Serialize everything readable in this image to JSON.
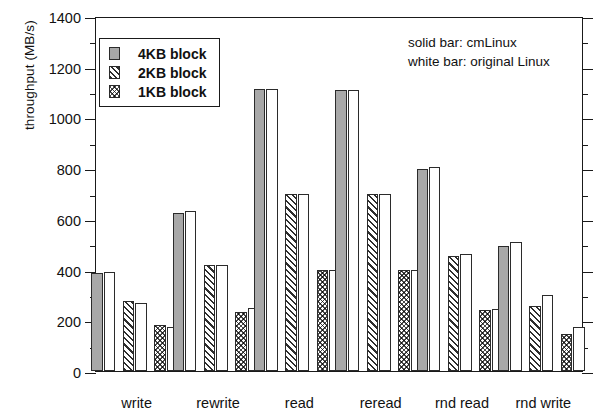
{
  "axes": {
    "ylabel": "throughput (MB/s)",
    "yticks": [
      0,
      200,
      400,
      600,
      800,
      1000,
      1200,
      1400
    ],
    "ymin": 0,
    "ymax": 1400,
    "minor_tick_step": 100,
    "xlabel": ""
  },
  "legend": {
    "items": [
      {
        "label": "4KB block",
        "pattern": "solid-gray",
        "key": "k4"
      },
      {
        "label": "2KB block",
        "pattern": "diagonal-hatch",
        "key": "k2"
      },
      {
        "label": "1KB block",
        "pattern": "crosshatch-dots",
        "key": "k1"
      }
    ]
  },
  "annotation": {
    "line1": "solid bar: cmLinux",
    "line2": "white bar: original Linux"
  },
  "chart_data": {
    "type": "bar",
    "title": "",
    "xlabel": "",
    "ylabel": "throughput (MB/s)",
    "ylim": [
      0,
      1400
    ],
    "grid": false,
    "legend_position": "upper-left",
    "categories": [
      "write",
      "rewrite",
      "read",
      "reread",
      "rnd read",
      "rnd write"
    ],
    "series": [
      {
        "name": "4KB block cmLinux",
        "fill": "solid-gray",
        "values": [
          388,
          622,
          1113,
          1110,
          795,
          492
        ]
      },
      {
        "name": "4KB block original Linux",
        "fill": "white",
        "values": [
          390,
          632,
          1113,
          1110,
          805,
          508
        ]
      },
      {
        "name": "2KB block cmLinux",
        "fill": "diagonal-hatch",
        "values": [
          277,
          420,
          700,
          698,
          452,
          258
        ]
      },
      {
        "name": "2KB block original Linux",
        "fill": "white",
        "values": [
          270,
          420,
          697,
          698,
          460,
          300
        ]
      },
      {
        "name": "1KB block cmLinux",
        "fill": "crosshatch-dots",
        "values": [
          180,
          232,
          400,
          398,
          242,
          147
        ]
      },
      {
        "name": "1KB block original Linux",
        "fill": "white",
        "values": [
          173,
          248,
          400,
          398,
          243,
          172
        ]
      }
    ],
    "annotations": [
      "solid bar: cmLinux",
      "white bar: original Linux"
    ]
  }
}
